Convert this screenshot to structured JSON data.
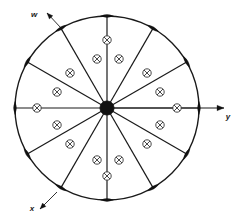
{
  "figure": {
    "background_color": "#ffffff",
    "line_color": "#1a1a1a",
    "marker_color": "#111111",
    "symbol_color": "#333333",
    "width": 240,
    "height": 221
  },
  "geometry": {
    "center_x": 107,
    "center_y": 108,
    "radius": 92,
    "hub_radius": 7,
    "spoke_count": 12,
    "spoke_angle_step_deg": 30,
    "rim_marker_count": 12,
    "rim_marker_length": 13,
    "rim_marker_width": 4.5
  },
  "axes": [
    {
      "id": "y-axis",
      "label": "y",
      "direction_deg": 0,
      "label_x": 228,
      "label_y": 119,
      "arrow_tip_x": 224,
      "arrow_tip_y": 108,
      "arrow": true,
      "from_center": true
    },
    {
      "id": "w-axis",
      "label": "w",
      "direction_deg": 150,
      "label_x": 34,
      "label_y": 17,
      "arrow_tip_x": 47,
      "arrow_tip_y": 13,
      "arrow": true,
      "from_center": false,
      "leader_from_x": 61,
      "leader_from_y": 28
    },
    {
      "id": "x-axis",
      "label": "x",
      "direction_deg": 240,
      "label_x": 32,
      "label_y": 211,
      "arrow_tip_x": 40,
      "arrow_tip_y": 209,
      "arrow": true,
      "from_center": false,
      "leader_from_x": 57,
      "leader_from_y": 192
    }
  ],
  "spokes": [
    {
      "index": 0,
      "angle_deg": 0
    },
    {
      "index": 1,
      "angle_deg": 30
    },
    {
      "index": 2,
      "angle_deg": 60
    },
    {
      "index": 3,
      "angle_deg": 90
    },
    {
      "index": 4,
      "angle_deg": 120
    },
    {
      "index": 5,
      "angle_deg": 150
    },
    {
      "index": 6,
      "angle_deg": 180
    },
    {
      "index": 7,
      "angle_deg": 210
    },
    {
      "index": 8,
      "angle_deg": 240
    },
    {
      "index": 9,
      "angle_deg": 270
    },
    {
      "index": 10,
      "angle_deg": 300
    },
    {
      "index": 11,
      "angle_deg": 330
    }
  ],
  "current_symbols": {
    "glyph": "circle-with-x",
    "meaning": "current into page",
    "radius": 4.2,
    "count": 16,
    "positions": [
      {
        "x": 97,
        "y": 59
      },
      {
        "x": 119,
        "y": 59
      },
      {
        "x": 70,
        "y": 73
      },
      {
        "x": 147,
        "y": 73
      },
      {
        "x": 57,
        "y": 92
      },
      {
        "x": 160,
        "y": 92
      },
      {
        "x": 57,
        "y": 125
      },
      {
        "x": 160,
        "y": 125
      },
      {
        "x": 70,
        "y": 144
      },
      {
        "x": 147,
        "y": 144
      },
      {
        "x": 97,
        "y": 160
      },
      {
        "x": 119,
        "y": 160
      },
      {
        "x": 37,
        "y": 108
      },
      {
        "x": 177,
        "y": 108
      },
      {
        "x": 107,
        "y": 40
      },
      {
        "x": 107,
        "y": 176
      }
    ]
  }
}
